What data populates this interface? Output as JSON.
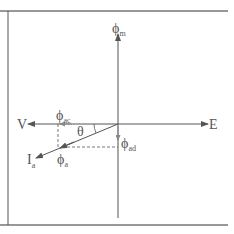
{
  "diagram": {
    "type": "phasor-diagram",
    "colors": {
      "line": "#555555",
      "frame": "#333333",
      "text": "#555555"
    },
    "labels": {
      "phi_m": {
        "symbol": "ϕ",
        "sub": "m"
      },
      "E": {
        "symbol": "E"
      },
      "V": {
        "symbol": "V"
      },
      "phi_ac": {
        "symbol": "ϕ",
        "sub": "ac"
      },
      "phi_ad": {
        "symbol": "ϕ",
        "sub": "ad"
      },
      "phi_a": {
        "symbol": "ϕ",
        "sub": "a"
      },
      "Ia": {
        "symbol": "I",
        "sub": "a"
      },
      "theta": {
        "symbol": "θ"
      }
    }
  }
}
